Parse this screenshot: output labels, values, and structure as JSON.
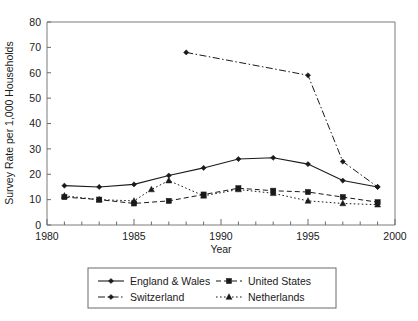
{
  "chart_data": {
    "type": "line",
    "title": "",
    "xlabel": "Year",
    "ylabel": "Survey Rate per 1,000 Households",
    "xlim": [
      1980,
      2000
    ],
    "ylim": [
      0,
      80
    ],
    "xticks": [
      1980,
      1985,
      1990,
      1995,
      2000
    ],
    "yticks": [
      0,
      10,
      20,
      30,
      40,
      50,
      60,
      70,
      80
    ],
    "xtick_labels": [
      "1980",
      "1985",
      "1990",
      "1995",
      "2000"
    ],
    "ytick_labels": [
      "0",
      "10",
      "20",
      "30",
      "40",
      "50",
      "60",
      "70",
      "80"
    ],
    "grid": false,
    "legend_position": "bottom",
    "minor_xticks_interval": 1,
    "series": [
      {
        "name": "England & Wales",
        "line_style": "solid",
        "marker": "diamond",
        "x": [
          1981,
          1983,
          1985,
          1987,
          1989,
          1991,
          1993,
          1995,
          1997,
          1999
        ],
        "values": [
          15.5,
          15.0,
          16.0,
          19.5,
          22.5,
          26.0,
          26.5,
          24.0,
          17.5,
          15.0
        ]
      },
      {
        "name": "United States",
        "line_style": "dashed",
        "marker": "square",
        "x": [
          1981,
          1983,
          1985,
          1987,
          1989,
          1991,
          1993,
          1995,
          1997,
          1999
        ],
        "values": [
          11.0,
          10.0,
          8.5,
          9.5,
          12.0,
          14.5,
          13.5,
          13.0,
          11.0,
          9.0
        ]
      },
      {
        "name": "Switzerland",
        "line_style": "dashdot",
        "marker": "diamond",
        "x": [
          1988,
          1995,
          1997,
          1999
        ],
        "values": [
          68.0,
          59.0,
          25.0,
          15.0
        ]
      },
      {
        "name": "Netherlands",
        "line_style": "dotted",
        "marker": "triangle",
        "x": [
          1981,
          1983,
          1985,
          1986,
          1987,
          1989,
          1991,
          1993,
          1995,
          1997,
          1999
        ],
        "values": [
          11.5,
          10.0,
          9.5,
          14.0,
          17.5,
          11.5,
          14.0,
          12.5,
          9.5,
          8.5,
          8.0
        ]
      }
    ]
  },
  "legend": {
    "items": [
      {
        "label": "England & Wales",
        "style": "solid",
        "marker": "diamond"
      },
      {
        "label": "United States",
        "style": "dashed",
        "marker": "square"
      },
      {
        "label": "Switzerland",
        "style": "dashdot",
        "marker": "diamond"
      },
      {
        "label": "Netherlands",
        "style": "dotted",
        "marker": "triangle"
      }
    ]
  }
}
